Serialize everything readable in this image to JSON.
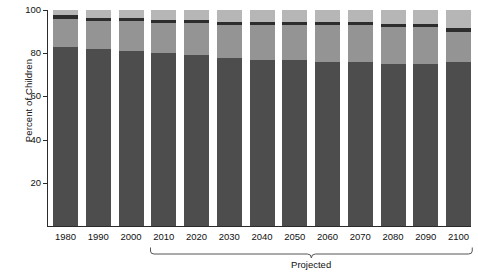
{
  "chart_data": {
    "type": "bar",
    "title": "",
    "subtitle": "",
    "xlabel": "",
    "ylabel": "Percent of Children",
    "ylim": [
      0,
      100
    ],
    "yticks": [
      20,
      40,
      60,
      80,
      100
    ],
    "ytick_labels": [
      "20",
      "40",
      "60",
      "80",
      "100"
    ],
    "grid": false,
    "legend": "none",
    "stacked": true,
    "stack_total": 100,
    "categories": [
      "1980",
      "1990",
      "2000",
      "2010",
      "2020",
      "2030",
      "2040",
      "2050",
      "2060",
      "2070",
      "2080",
      "2090",
      "2100"
    ],
    "series": [
      {
        "name": "segment-1",
        "color": "#4d4d4d",
        "values": [
          83,
          82,
          81,
          80,
          79,
          78,
          77,
          77,
          76,
          76,
          75,
          75,
          76
        ]
      },
      {
        "name": "segment-2",
        "color": "#949494",
        "values": [
          13,
          13,
          14,
          14,
          15,
          15,
          16,
          16,
          17,
          17,
          17,
          17,
          14
        ]
      },
      {
        "name": "segment-3",
        "color": "#2d2d2d",
        "values": [
          1.5,
          1.5,
          1.5,
          1.5,
          1.5,
          1.5,
          1.5,
          1.5,
          1.5,
          1.5,
          1.5,
          1.5,
          1.5
        ]
      },
      {
        "name": "segment-4",
        "color": "#b6b6b6",
        "values": [
          2.5,
          3.5,
          3.5,
          4.5,
          4.5,
          5.5,
          5.5,
          5.5,
          5.5,
          5.5,
          6.5,
          6.5,
          8.5
        ]
      }
    ],
    "segment_tops": {
      "note": "cumulative top of each stacked segment, percent",
      "segment-1": [
        83,
        82,
        81,
        80,
        79,
        78,
        77,
        77,
        76,
        76,
        75,
        75,
        76
      ],
      "segment-2": [
        96,
        95,
        95,
        94,
        94,
        93,
        93,
        93,
        93,
        93,
        92,
        92,
        90
      ],
      "segment-3": [
        97.5,
        96.5,
        96.5,
        95.5,
        95.5,
        94.5,
        94.5,
        94.5,
        94.5,
        94.5,
        93.5,
        93.5,
        91.5
      ],
      "segment-4": [
        100,
        100,
        100,
        100,
        100,
        100,
        100,
        100,
        100,
        100,
        100,
        100,
        100
      ]
    },
    "annotations": [
      {
        "name": "projected-bracket",
        "label": "Projected",
        "from_category": "2010",
        "to_category": "2100"
      }
    ]
  },
  "axis": {
    "y_title": "Percent of Children"
  },
  "projected": {
    "label": "Projected"
  }
}
